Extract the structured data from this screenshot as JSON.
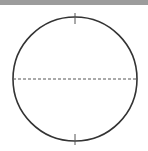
{
  "diagram": {
    "type": "circle-with-diameter",
    "colors": {
      "band": "#9c9c9c",
      "stroke": "#333333",
      "dash": "#555555",
      "tick": "#555555",
      "background": "#ffffff"
    },
    "circle": {
      "cx": 75,
      "cy": 79,
      "r": 62
    },
    "diameter": {
      "style": "dashed",
      "orientation": "horizontal"
    },
    "ticks": [
      "top",
      "bottom"
    ]
  }
}
